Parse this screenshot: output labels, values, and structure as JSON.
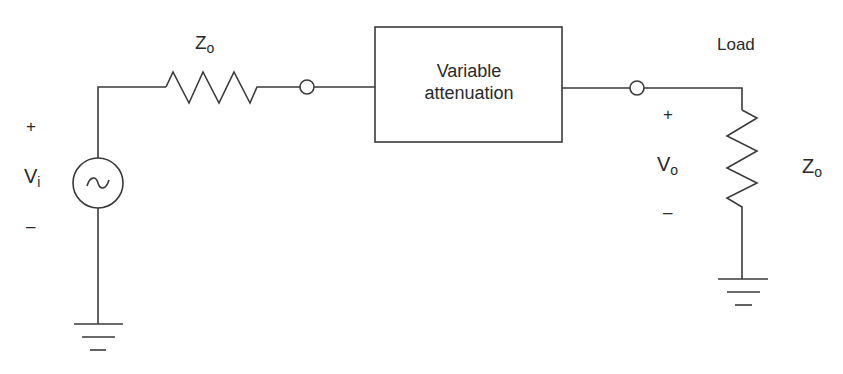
{
  "diagram": {
    "type": "circuit-schematic",
    "source": {
      "label_main": "V",
      "label_sub": "i",
      "plus": "+",
      "minus": "–",
      "symbol": "~"
    },
    "series_resistor": {
      "label_main": "Z",
      "label_sub": "o"
    },
    "attenuator_block": {
      "line1": "Variable",
      "line2": "attenuation"
    },
    "output": {
      "label_main": "V",
      "label_sub": "o",
      "plus": "+",
      "minus": "–"
    },
    "load": {
      "title": "Load",
      "label_main": "Z",
      "label_sub": "o"
    },
    "colors": {
      "line": "#3a3a3a",
      "text": "#2a2a2a",
      "background": "#ffffff"
    }
  }
}
